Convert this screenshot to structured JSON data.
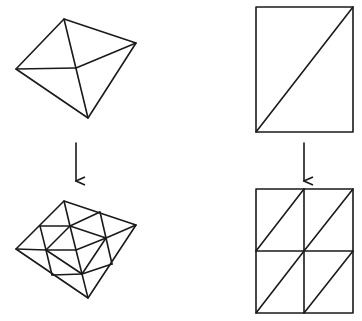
{
  "diagram": {
    "title": "",
    "description": "Mesh refinement: coarse triangulations (top) subdivided into finer triangulations (bottom)",
    "colors": {
      "stroke": "#1a1a1a",
      "background": "#ffffff"
    },
    "panels": [
      {
        "name": "coarse-quad-mesh",
        "vertices": {
          "top": [
            64,
            19
          ],
          "right": [
            136,
            43
          ],
          "left": [
            16,
            69
          ],
          "bottom": [
            88,
            118
          ],
          "center": [
            76,
            68
          ]
        },
        "edges": [
          [
            "top",
            "right"
          ],
          [
            "right",
            "bottom"
          ],
          [
            "bottom",
            "left"
          ],
          [
            "left",
            "top"
          ],
          [
            "top",
            "bottom"
          ],
          [
            "left",
            "center"
          ],
          [
            "center",
            "right"
          ]
        ]
      },
      {
        "name": "coarse-rect-mesh",
        "rect": {
          "x": 256,
          "y": 7,
          "w": 97,
          "h": 125
        },
        "diagonal": [
          [
            256,
            132
          ],
          [
            353,
            7
          ]
        ]
      },
      {
        "name": "refined-quad-mesh",
        "triangle_count": 16
      },
      {
        "name": "refined-rect-mesh",
        "rect": {
          "x": 256,
          "y": 189,
          "w": 97,
          "h": 124
        },
        "grid": "2x2",
        "triangle_count": 8
      }
    ],
    "arrows": [
      {
        "name": "refine-arrow-left",
        "from": [
          76,
          143
        ],
        "to": [
          76,
          180
        ]
      },
      {
        "name": "refine-arrow-right",
        "from": [
          304,
          143
        ],
        "to": [
          304,
          180
        ]
      }
    ]
  }
}
